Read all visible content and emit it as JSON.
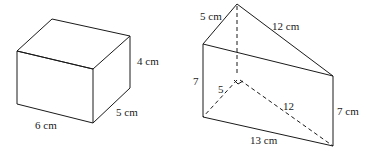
{
  "figures": [
    {
      "id": "rectangular-prism",
      "shape": "rectangular box",
      "labels": {
        "length": "6 cm",
        "width": "5 cm",
        "height": "4 cm"
      }
    },
    {
      "id": "triangular-prism",
      "shape": "right triangular prism",
      "labels": {
        "top_left_edge": "5 cm",
        "top_right_edge": "12 cm",
        "left_height": "7",
        "right_height": "7 cm",
        "base_hidden_short": "5",
        "base_hidden_long": "12",
        "base_front": "13 cm"
      },
      "right_angle_marker": true
    }
  ],
  "colors": {
    "stroke": "#1a1a1a",
    "background": "#ffffff"
  }
}
